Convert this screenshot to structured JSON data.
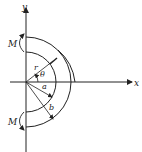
{
  "diagram": {
    "type": "thick-walled semicircular ring under bending moments",
    "axes": {
      "x_label": "x",
      "y_label": "y"
    },
    "labels": {
      "radius_r": "r",
      "angle": "θ",
      "inner_radius": "a",
      "outer_radius": "b",
      "moment_top": "M",
      "moment_bottom": "M"
    },
    "colors": {
      "line": "#222222",
      "background": "#ffffff"
    }
  }
}
